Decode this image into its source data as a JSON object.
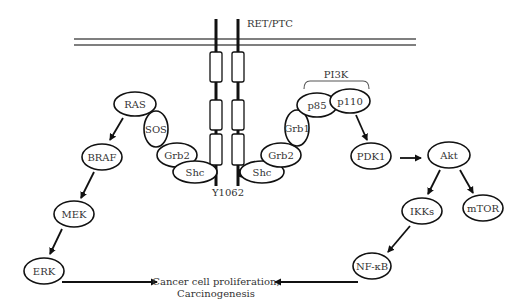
{
  "diagram": {
    "receptor": {
      "label": "RET/PTC",
      "phosphosite_label": "Y1062",
      "membrane": {
        "x1": 74,
        "x2": 416,
        "y_outer": 39,
        "y_inner": 45
      },
      "strands_x": [
        216,
        238
      ],
      "strand_top": 19,
      "strand_bottom": 186,
      "domains_y": [
        [
          52,
          82
        ],
        [
          100,
          130
        ],
        [
          134,
          165
        ]
      ],
      "phospho_dots": [
        [
          213,
          173
        ],
        [
          242,
          173
        ]
      ]
    },
    "complex_label": "PI3K",
    "outcome": {
      "line1": "Cancer cell proliferation,",
      "line2": "Carcinogenesis"
    },
    "nodes": [
      {
        "id": "ras",
        "label": "RAS",
        "cx": 135,
        "cy": 104,
        "rx": 21,
        "ry": 12
      },
      {
        "id": "sos",
        "label": "SOS",
        "cx": 156,
        "cy": 129,
        "rx": 12,
        "ry": 18
      },
      {
        "id": "grb2-left",
        "label": "Grb2",
        "cx": 177,
        "cy": 155,
        "rx": 20,
        "ry": 12
      },
      {
        "id": "shc-left",
        "label": "Shc",
        "cx": 195,
        "cy": 172,
        "rx": 22,
        "ry": 11
      },
      {
        "id": "shc-right",
        "label": "Shc",
        "cx": 262,
        "cy": 172,
        "rx": 22,
        "ry": 11
      },
      {
        "id": "grb2-right",
        "label": "Grb2",
        "cx": 281,
        "cy": 155,
        "rx": 20,
        "ry": 12
      },
      {
        "id": "grb1",
        "label": "Grb1",
        "cx": 297,
        "cy": 128,
        "rx": 12,
        "ry": 18
      },
      {
        "id": "p85",
        "label": "p85",
        "cx": 317,
        "cy": 105,
        "rx": 20,
        "ry": 12
      },
      {
        "id": "p110",
        "label": "p110",
        "cx": 350,
        "cy": 101,
        "rx": 20,
        "ry": 12
      },
      {
        "id": "braf",
        "label": "BRAF",
        "cx": 102,
        "cy": 157,
        "rx": 20,
        "ry": 13
      },
      {
        "id": "mek",
        "label": "MEK",
        "cx": 74,
        "cy": 214,
        "rx": 20,
        "ry": 13
      },
      {
        "id": "erk",
        "label": "ERK",
        "cx": 44,
        "cy": 271,
        "rx": 20,
        "ry": 13
      },
      {
        "id": "pdk1",
        "label": "PDK1",
        "cx": 371,
        "cy": 156,
        "rx": 20,
        "ry": 13
      },
      {
        "id": "akt",
        "label": "Akt",
        "cx": 449,
        "cy": 155,
        "rx": 21,
        "ry": 13
      },
      {
        "id": "ikks",
        "label": "IKKs",
        "cx": 422,
        "cy": 211,
        "rx": 20,
        "ry": 13
      },
      {
        "id": "mtor",
        "label": "mTOR",
        "cx": 483,
        "cy": 208,
        "rx": 20,
        "ry": 13
      },
      {
        "id": "nfkb",
        "label": "NF-κB",
        "cx": 372,
        "cy": 266,
        "rx": 19,
        "ry": 13
      }
    ],
    "edges": [
      {
        "from": "ras",
        "to": "braf",
        "x1": 123,
        "y1": 118,
        "x2": 110,
        "y2": 140
      },
      {
        "from": "braf",
        "to": "mek",
        "x1": 94,
        "y1": 172,
        "x2": 81,
        "y2": 198
      },
      {
        "from": "mek",
        "to": "erk",
        "x1": 62,
        "y1": 229,
        "x2": 50,
        "y2": 254
      },
      {
        "from": "erk",
        "to": "outcome",
        "x1": 62,
        "y1": 282,
        "x2": 157,
        "y2": 282
      },
      {
        "from": "p110",
        "to": "pdk1",
        "x1": 356,
        "y1": 115,
        "x2": 367,
        "y2": 140
      },
      {
        "from": "pdk1",
        "to": "akt",
        "x1": 400,
        "y1": 158,
        "x2": 421,
        "y2": 158
      },
      {
        "from": "akt",
        "to": "ikks",
        "x1": 440,
        "y1": 170,
        "x2": 428,
        "y2": 194
      },
      {
        "from": "akt",
        "to": "mtor",
        "x1": 460,
        "y1": 170,
        "x2": 473,
        "y2": 193
      },
      {
        "from": "ikks",
        "to": "nfkb",
        "x1": 410,
        "y1": 226,
        "x2": 388,
        "y2": 252
      },
      {
        "from": "nfkb",
        "to": "outcome",
        "x1": 358,
        "y1": 282,
        "x2": 275,
        "y2": 282
      }
    ]
  }
}
